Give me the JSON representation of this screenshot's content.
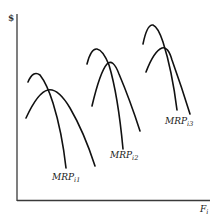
{
  "diagram": {
    "y_axis_label": "$",
    "x_axis_label": {
      "main": "F",
      "sub": "i"
    },
    "curves": [
      {
        "label_main": "MRP",
        "label_sub": "i1"
      },
      {
        "label_main": "MRP",
        "label_sub": "i2"
      },
      {
        "label_main": "MRP",
        "label_sub": "i3"
      }
    ],
    "colors": {
      "curve": "#111111",
      "axis": "#3a3a3a",
      "background": "#ffffff"
    }
  }
}
